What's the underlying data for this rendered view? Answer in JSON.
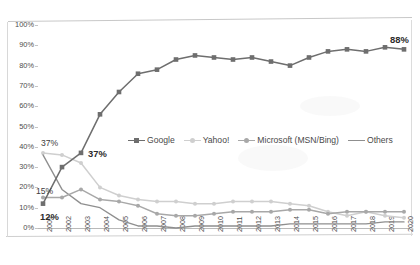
{
  "chart_data": {
    "type": "line",
    "title": "",
    "subtitle": "",
    "xlabel": "",
    "ylabel": "",
    "categories": [
      "2001",
      "2002",
      "2003",
      "2004",
      "2005",
      "2006",
      "2007",
      "2008",
      "2009",
      "2010",
      "2011",
      "2012",
      "2013",
      "2014",
      "2015",
      "2016",
      "2017",
      "2018",
      "2019",
      "2020"
    ],
    "ytick_labels": [
      "100%",
      "90%",
      "80%",
      "70%",
      "60%",
      "50%",
      "40%",
      "30%",
      "20%",
      "10%",
      "0%"
    ],
    "ytick_values": [
      100,
      90,
      80,
      70,
      60,
      50,
      40,
      30,
      20,
      10,
      0
    ],
    "ylim": [
      0,
      100
    ],
    "grid": false,
    "legend_position": "inside-center",
    "series": [
      {
        "name": "Google",
        "color": "#6e6e6e",
        "marker": "square",
        "values": [
          12,
          30,
          37,
          56,
          67,
          76,
          78,
          83,
          85,
          84,
          83,
          84,
          82,
          80,
          84,
          87,
          88,
          87,
          89,
          88
        ]
      },
      {
        "name": "Yahoo!",
        "color": "#cfcfcf",
        "marker": "circle",
        "values": [
          37,
          36,
          32,
          20,
          16,
          14,
          13,
          13,
          12,
          12,
          13,
          13,
          13,
          12,
          11,
          8,
          6,
          8,
          6,
          5
        ]
      },
      {
        "name": "Microsoft (MSN/Bing)",
        "color": "#a8a8a8",
        "marker": "circle",
        "values": [
          15,
          15,
          19,
          14,
          13,
          11,
          7,
          6,
          6,
          7,
          8,
          8,
          8,
          9,
          9,
          7,
          8,
          8,
          8,
          8
        ]
      },
      {
        "name": "Others",
        "color": "#8f8f8f",
        "marker": "none",
        "values": [
          36,
          19,
          12,
          10,
          4,
          1,
          1,
          0,
          1,
          1,
          1,
          1,
          1,
          2,
          2,
          2,
          2,
          2,
          3,
          3
        ]
      }
    ],
    "annotations": [
      {
        "text": "37%",
        "series": "Yahoo!",
        "category": "2001",
        "style": "plain"
      },
      {
        "text": "15%",
        "series": "Microsoft (MSN/Bing)",
        "category": "2001",
        "style": "plain"
      },
      {
        "text": "12%",
        "series": "Google",
        "category": "2001",
        "style": "bold"
      },
      {
        "text": "37%",
        "series": "Google",
        "category": "2003",
        "style": "bold"
      },
      {
        "text": "88%",
        "series": "Google",
        "category": "2020",
        "style": "bold"
      }
    ]
  },
  "legend": {
    "items": [
      {
        "label": "Google"
      },
      {
        "label": "Yahoo!"
      },
      {
        "label": "Microsoft (MSN/Bing)"
      },
      {
        "label": "Others"
      }
    ]
  }
}
